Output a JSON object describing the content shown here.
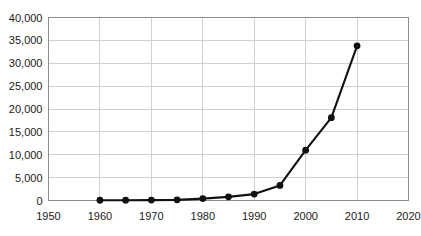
{
  "chart_data": {
    "type": "line",
    "title": "",
    "subtitle": "",
    "xlabel": "",
    "ylabel": "",
    "x": [
      1960,
      1965,
      1970,
      1975,
      1980,
      1985,
      1990,
      1995,
      2000,
      2005,
      2010
    ],
    "values": [
      60,
      70,
      90,
      140,
      420,
      800,
      1400,
      3300,
      11000,
      18100,
      33800
    ],
    "series": [
      {
        "name": "",
        "x": [
          1960,
          1965,
          1970,
          1975,
          1980,
          1985,
          1990,
          1995,
          2000,
          2005,
          2010
        ],
        "values": [
          60,
          70,
          90,
          140,
          420,
          800,
          1400,
          3300,
          11000,
          18100,
          33800
        ]
      }
    ],
    "xlim": [
      1950,
      2020
    ],
    "ylim": [
      0,
      40000
    ],
    "xticks": [
      1950,
      1960,
      1970,
      1980,
      1990,
      2000,
      2010,
      2020
    ],
    "yticks": [
      0,
      5000,
      10000,
      15000,
      20000,
      25000,
      30000,
      35000,
      40000
    ],
    "xticklabels": [
      "1950",
      "1960",
      "1970",
      "1980",
      "1990",
      "2000",
      "2010",
      "2020"
    ],
    "yticklabels": [
      "0",
      "5,000",
      "10,000",
      "15,000",
      "20,000",
      "25,000",
      "30,000",
      "35,000",
      "40,000"
    ],
    "grid": true,
    "grid_axes": "both",
    "legend": false,
    "legend_position": "none",
    "marker": "circle",
    "annotations": [],
    "colors": {
      "line": "#111111",
      "marker": "#111111",
      "gridline": "#d0d0d0",
      "plot_border": "#8c8c8c",
      "background": "#ffffff",
      "tick_text": "#1a1a1a"
    }
  }
}
